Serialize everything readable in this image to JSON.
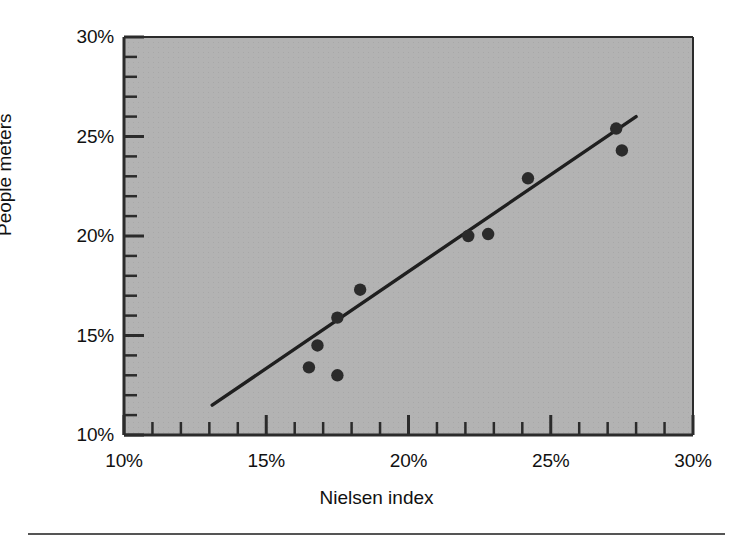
{
  "chart_data": {
    "type": "scatter",
    "title": "",
    "xlabel": "Nielsen index",
    "ylabel": "People meters",
    "xlim": [
      10,
      30
    ],
    "ylim": [
      10,
      30
    ],
    "x_ticks": [
      10,
      15,
      20,
      25,
      30
    ],
    "y_ticks": [
      10,
      15,
      20,
      25,
      30
    ],
    "x_tick_labels": [
      "10%",
      "15%",
      "20%",
      "25%",
      "30%"
    ],
    "y_tick_labels": [
      "10%",
      "15%",
      "20%",
      "25%",
      "30%"
    ],
    "x_minor_tick_step": 1,
    "y_minor_tick_step": 1,
    "grid": false,
    "legend": null,
    "points": [
      {
        "x": 16.5,
        "y": 13.4
      },
      {
        "x": 16.8,
        "y": 14.5
      },
      {
        "x": 17.5,
        "y": 13.0
      },
      {
        "x": 17.5,
        "y": 15.9
      },
      {
        "x": 18.3,
        "y": 17.3
      },
      {
        "x": 22.1,
        "y": 20.0
      },
      {
        "x": 22.8,
        "y": 20.1
      },
      {
        "x": 24.2,
        "y": 22.9
      },
      {
        "x": 27.3,
        "y": 25.4
      },
      {
        "x": 27.5,
        "y": 24.3
      }
    ],
    "trend_line": {
      "label": "fitted line",
      "x_start": 13.1,
      "y_start": 11.5,
      "x_end": 28.0,
      "y_end": 26.0
    },
    "colors": {
      "panel_background": "#b3b3b3",
      "page_background": "#ffffff",
      "marker": "#2b2b2b",
      "line": "#1f1f1f",
      "axis": "#2b2b2b",
      "text": "#111111"
    }
  }
}
